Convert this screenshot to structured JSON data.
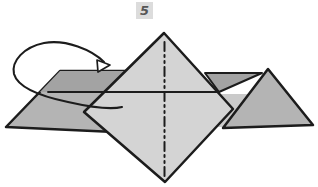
{
  "step_badge": {
    "number": "5"
  },
  "icons": {
    "fold_arrow": "curved-fold-direction-arrow",
    "fold_arrow_head": "hollow-triangle-arrowhead",
    "center_fold_line": "dash-dot-fold-line"
  },
  "colors": {
    "background": "#ffffff",
    "outline": "#1c1c1c",
    "paper_light": "#d4d4d4",
    "paper_mid": "#b4b4b4",
    "paper_dark": "#a3a3a3",
    "paper_sliver": "#cacaca",
    "badge_bg": "#dcdcdc",
    "badge_text": "#565656",
    "arrowhead_fill": "#ffffff"
  }
}
